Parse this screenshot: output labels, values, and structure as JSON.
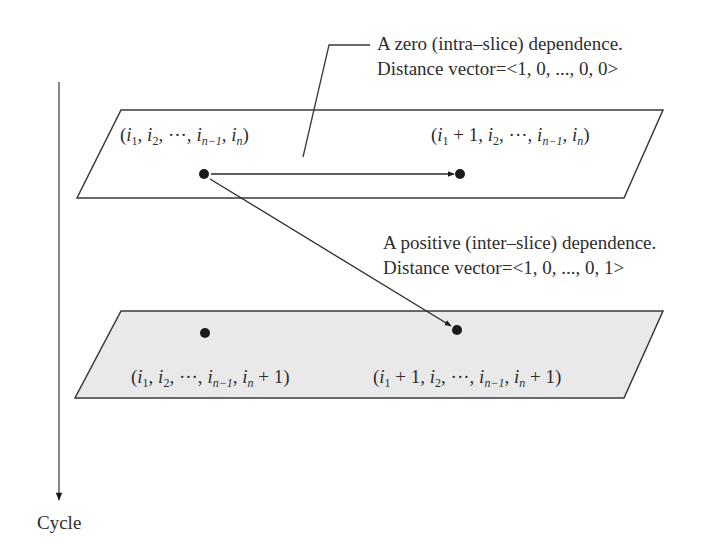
{
  "diagram": {
    "axis": {
      "label": "Cycle",
      "direction": "down"
    },
    "slices": [
      {
        "id": "slice-n",
        "fill": "#ffffff",
        "stroke": "#3a3a3a",
        "points": [
          {
            "label_parts": [
              "(",
              "i",
              "1",
              ", ",
              "i",
              "2",
              ", ···, ",
              "i",
              "n−1",
              ", ",
              "i",
              "n",
              ")"
            ],
            "text": "(i1, i2, ···, in−1, in)"
          },
          {
            "label_parts": [
              "(",
              "i",
              "1",
              " + 1, ",
              "i",
              "2",
              ", ···, ",
              "i",
              "n−1",
              ", ",
              "i",
              "n",
              ")"
            ],
            "text": "(i1 + 1, i2, ···, in−1, in)"
          }
        ]
      },
      {
        "id": "slice-n-plus-1",
        "fill": "#e9e9e9",
        "stroke": "#3a3a3a",
        "points": [
          {
            "text": "(i1, i2, ···, in−1, in + 1)"
          },
          {
            "text": "(i1 + 1, i2, ···, in−1, in + 1)"
          }
        ]
      }
    ],
    "annotations": {
      "zero": {
        "line1": "A zero (intra–slice) dependence.",
        "line2": "Distance vector=<1, 0, ..., 0, 0>"
      },
      "positive": {
        "line1": "A positive (inter–slice) dependence.",
        "line2": "Distance vector=<1, 0, ..., 0, 1>"
      }
    },
    "coords": {
      "top_left": {
        "pre": "(",
        "a": "i",
        "a_sub": "1",
        "sep1": ", ",
        "b": "i",
        "b_sub": "2",
        "sep2": ", ···, ",
        "c": "i",
        "c_sub": "n−1",
        "sep3": ", ",
        "d": "i",
        "d_sub": "n",
        "post": ")"
      },
      "top_right": {
        "pre": "(",
        "a": "i",
        "a_sub": "1",
        "sep1": " + 1, ",
        "b": "i",
        "b_sub": "2",
        "sep2": ", ···, ",
        "c": "i",
        "c_sub": "n−1",
        "sep3": ", ",
        "d": "i",
        "d_sub": "n",
        "post": ")"
      },
      "bottom_left": {
        "pre": "(",
        "a": "i",
        "a_sub": "1",
        "sep1": ", ",
        "b": "i",
        "b_sub": "2",
        "sep2": ", ···, ",
        "c": "i",
        "c_sub": "n−1",
        "sep3": ", ",
        "d": "i",
        "d_sub": "n",
        "post": " + 1)"
      },
      "bottom_right": {
        "pre": "(",
        "a": "i",
        "a_sub": "1",
        "sep1": " + 1, ",
        "b": "i",
        "b_sub": "2",
        "sep2": ", ···, ",
        "c": "i",
        "c_sub": "n−1",
        "sep3": ", ",
        "d": "i",
        "d_sub": "n",
        "post": " + 1)"
      }
    },
    "colors": {
      "stroke": "#3a3a3a",
      "dot": "#1a1a1a",
      "lower_fill": "#e9e9e9",
      "upper_fill": "#ffffff"
    }
  }
}
